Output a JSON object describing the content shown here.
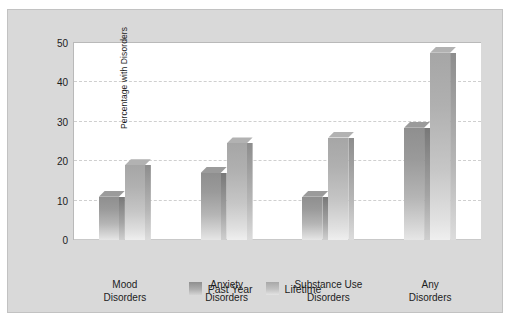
{
  "chart_data": {
    "type": "bar",
    "title": "",
    "subtitle": "",
    "xlabel": "",
    "ylabel": "Percentage with Disorders",
    "ylim": [
      0,
      50
    ],
    "yticks": [
      0,
      10,
      20,
      30,
      40,
      50
    ],
    "ytick_labels": [
      "0",
      "10",
      "20",
      "30",
      "40",
      "50"
    ],
    "grid": "horizontal-dashed",
    "legend_position": "bottom-center",
    "categories": [
      "Mood\nDisorders",
      "Anxiety\nDisorders",
      "Substance Use\nDisorders",
      "Any\nDisorders"
    ],
    "category_lines": [
      [
        "Mood",
        "Disorders"
      ],
      [
        "Anxiety",
        "Disorders"
      ],
      [
        "Substance Use",
        "Disorders"
      ],
      [
        "Any",
        "Disorders"
      ]
    ],
    "series": [
      {
        "name": "Past Year",
        "color": "#9a9a9a",
        "values": [
          11,
          17,
          11,
          28.5
        ]
      },
      {
        "name": "Lifetime",
        "color": "#bcbcbc",
        "values": [
          19,
          24.5,
          26,
          47.5
        ]
      }
    ]
  },
  "legend": {
    "items": [
      {
        "label": "Past Year",
        "swatch": "past-year-swatch"
      },
      {
        "label": "Lifetime",
        "swatch": "lifetime-swatch"
      }
    ]
  },
  "colors": {
    "panel": "#d9d9d9",
    "plot_background": "#ffffff",
    "gridline": "#cfcfcf",
    "text": "#1c1c1c",
    "past_year": "#9a9a9a",
    "lifetime": "#bcbcbc"
  }
}
